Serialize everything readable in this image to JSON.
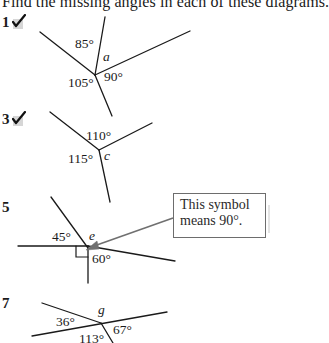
{
  "instruction": "Find the missing angles in each of these diagrams.",
  "questions": [
    {
      "number": "1",
      "checked": true,
      "angles": [
        "85°",
        "105°",
        "90°"
      ],
      "unknown": "a"
    },
    {
      "number": "3",
      "checked": true,
      "angles": [
        "110°",
        "115°"
      ],
      "unknown": "c"
    },
    {
      "number": "5",
      "checked": false,
      "angles": [
        "45°",
        "60°"
      ],
      "unknown": "e",
      "right_angle_marker": true
    },
    {
      "number": "7",
      "checked": false,
      "angles": [
        "36°",
        "67°",
        "113°"
      ],
      "unknown": "g"
    }
  ],
  "callout": {
    "line1": "This symbol",
    "line2": "means 90°."
  },
  "colors": {
    "ink": "#1a1a1a",
    "callout_border": "#6d6d6d",
    "arrow": "#707070",
    "check_bg": "#d6d6d6"
  }
}
